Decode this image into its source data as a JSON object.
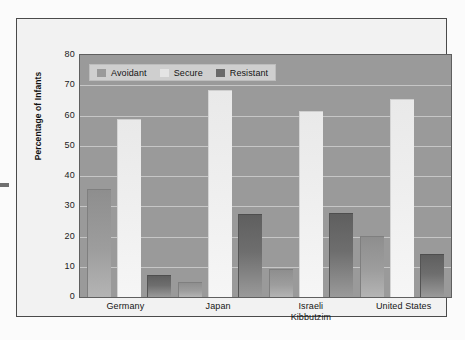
{
  "chart_data": {
    "type": "bar",
    "title": "",
    "subtitle": "",
    "xlabel": "",
    "ylabel": "Percentage of Infants",
    "ylim": [
      0,
      80
    ],
    "ytick_step": 10,
    "yticks": [
      "80",
      "70",
      "60",
      "50",
      "40",
      "30",
      "20",
      "10",
      "0"
    ],
    "grid": true,
    "legend_position": "top-left",
    "categories": [
      "Germany",
      "Japan",
      "Israeli Kibbutzim",
      "United States"
    ],
    "category_lines": [
      [
        "Germany"
      ],
      [
        "Japan"
      ],
      [
        "Israeli",
        "Kibbutzim"
      ],
      [
        "United States"
      ]
    ],
    "series": [
      {
        "name": "Avoidant",
        "color": "#9a9a9a",
        "values": [
          35.5,
          4.5,
          9.0,
          20.0
        ]
      },
      {
        "name": "Secure",
        "color": "#eeeeee",
        "values": [
          58.5,
          68.0,
          61.0,
          65.0
        ]
      },
      {
        "name": "Resistant",
        "color": "#6a6a6a",
        "values": [
          7.0,
          27.0,
          27.5,
          14.0
        ]
      }
    ]
  },
  "legend": {
    "items": [
      {
        "label": "Avoidant",
        "swatch": "avoidant"
      },
      {
        "label": "Secure",
        "swatch": "secure"
      },
      {
        "label": "Resistant",
        "swatch": "resistant"
      }
    ]
  },
  "colors": {
    "plot_background": "#9a9a9a",
    "figure_background": "#f2f2f2",
    "gridline": "#c6c6c6",
    "frame_border": "#4a4a4a",
    "axis_text": "#141414"
  }
}
